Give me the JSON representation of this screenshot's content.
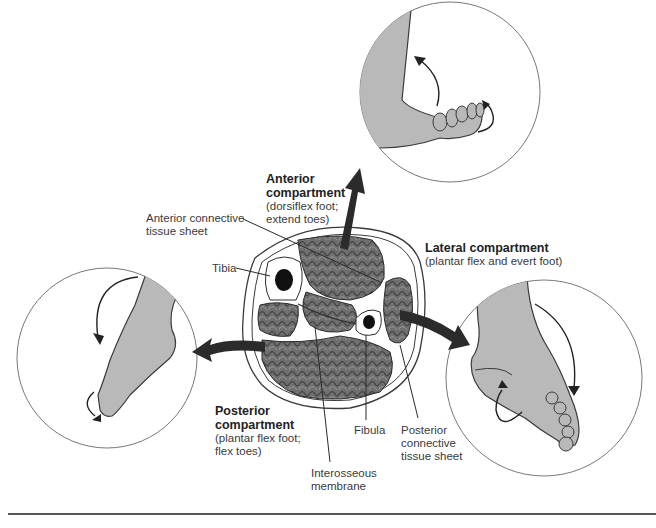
{
  "figure": {
    "colors": {
      "skin": "#b9b9b9",
      "outline": "#3a3a3a",
      "arrow": "#2b2b2b",
      "muscle": "#6f6f6f",
      "bone": "#111111",
      "rule": "#555555"
    },
    "compartments": {
      "anterior": {
        "title_line1": "Anterior",
        "title_line2": "compartment",
        "desc_line1": "(dorsiflex foot;",
        "desc_line2": "extend toes)"
      },
      "lateral": {
        "title": "Lateral compartment",
        "desc": "(plantar flex and evert foot)"
      },
      "posterior": {
        "title_line1": "Posterior",
        "title_line2": "compartment",
        "desc_line1": "(plantar flex foot;",
        "desc_line2": "flex toes)"
      }
    },
    "structures": {
      "anterior_sheet": {
        "line1": "Anterior connective",
        "line2": "tissue sheet"
      },
      "tibia": "Tibia",
      "fibula": "Fibula",
      "posterior_sheet": {
        "line1": "Posterior",
        "line2": "connective",
        "line3": "tissue sheet"
      },
      "interosseous": {
        "line1": "Interosseous",
        "line2": "membrane"
      }
    }
  }
}
